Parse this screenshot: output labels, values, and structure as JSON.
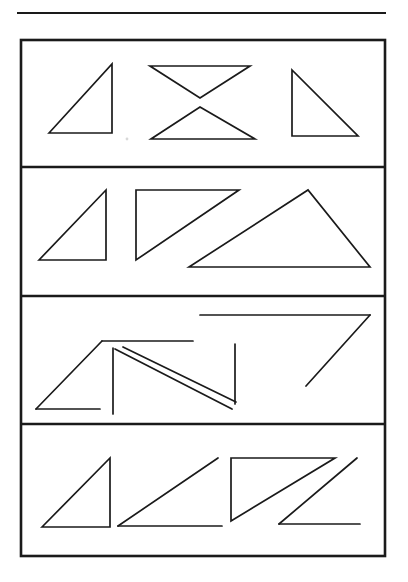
{
  "document": {
    "kind": "scanned-figure-page",
    "background_color": "#ffffff",
    "ink_color": "#1a1a1a",
    "width": 408,
    "height": 582,
    "top_rule": {
      "name": "horizontal-rule",
      "x1": 17,
      "y1": 13,
      "x2": 386,
      "y2": 13
    },
    "frame": {
      "name": "figure-frame",
      "x": 21,
      "y": 40,
      "width": 364,
      "height": 516
    },
    "dividers": [
      {
        "name": "row-divider-1",
        "y": 167
      },
      {
        "name": "row-divider-2",
        "y": 296
      },
      {
        "name": "row-divider-3",
        "y": 424
      }
    ],
    "speck": {
      "name": "scan-speck",
      "cx": 127,
      "cy": 139,
      "r": 1.4
    }
  },
  "rows": [
    {
      "name": "row-1",
      "label": "Row 1",
      "bounds": {
        "y_top": 40,
        "y_bottom": 167
      },
      "figure_count": 4,
      "figures": [
        {
          "name": "triangle-right-apex-top-right",
          "closed": true,
          "description": "Closed right triangle, right angle at top-right, hypotenuse from top-right down to bottom-left",
          "points": "108,133 108,133 108,133",
          "path": "M 49,133 L 112,64 L 112,133 Z"
        },
        {
          "name": "triangle-inverted-top",
          "closed": true,
          "description": "Closed downward-pointing triangle, horizontal top edge, apex pointing down",
          "path": "M 150,66 L 250,66 L 200,98 Z"
        },
        {
          "name": "triangle-upright-bottom",
          "closed": true,
          "description": "Closed upward-pointing triangle, apex up, horizontal bottom edge",
          "path": "M 200,107 L 255,139 L 151,139 Z"
        },
        {
          "name": "triangle-right-apex-top-left",
          "closed": true,
          "description": "Closed right triangle, vertical left side, hypotenuse from top-left to bottom-right",
          "path": "M 292,70 L 292,136 L 358,136 Z"
        }
      ]
    },
    {
      "name": "row-2",
      "label": "Row 2",
      "bounds": {
        "y_top": 167,
        "y_bottom": 296
      },
      "figure_count": 3,
      "figures": [
        {
          "name": "triangle-small-right-apex-top-right",
          "closed": true,
          "description": "Small closed right triangle, right angle at bottom-right",
          "path": "M 39,260 L 106,190 L 106,260 Z"
        },
        {
          "name": "triangle-right-apex-top-right-tall",
          "closed": true,
          "description": "Closed right triangle, vertical left side, horizontal top side, hypotenuse descending left",
          "path": "M 136,190 L 239,190 L 136,260 Z"
        },
        {
          "name": "triangle-obtuse-wide",
          "closed": true,
          "description": "Closed wide obtuse triangle, apex near top-center-right, long horizontal base",
          "path": "M 189,267 L 308,190 L 370,267 Z"
        }
      ]
    },
    {
      "name": "row-3",
      "label": "Row 3",
      "bounds": {
        "y_top": 296,
        "y_bottom": 424
      },
      "figure_count": 3,
      "note": "Incomplete / broken triangle outlines composed of open line segments",
      "figures": [
        {
          "name": "open-triangle-gapped-left",
          "closed": false,
          "description": "Open triangle: apex top, long diagonal down-left, truncated horizontal base",
          "segments": [
            "M 102,341 L 36,409",
            "M 36,409 L 100,409",
            "M 102,341 L 193,341"
          ]
        },
        {
          "name": "open-triangle-sliver-center",
          "closed": false,
          "description": "Two near-parallel diagonals forming a narrow sliver plus detached vertical strokes",
          "segments": [
            "M 113,348 L 113,414",
            "M 115,349 L 232,409",
            "M 123,347 L 236,402",
            "M 235,344 L 235,404"
          ]
        },
        {
          "name": "open-seven-shape-right",
          "closed": false,
          "description": "Seven-like open figure: long horizontal top stroke then a diagonal descending to the left",
          "segments": [
            "M 200,315 L 370,315",
            "M 370,315 L 306,386"
          ]
        }
      ]
    },
    {
      "name": "row-4",
      "label": "Row 4",
      "bounds": {
        "y_top": 424,
        "y_bottom": 556
      },
      "figure_count": 4,
      "figures": [
        {
          "name": "triangle-closed-right-angle-bottom-right",
          "closed": true,
          "description": "Closed right triangle, right angle at bottom-right, hypotenuse from top-right to bottom-left",
          "path": "M 42,527 L 110,458 L 110,527 Z"
        },
        {
          "name": "open-wedge-missing-vertical",
          "closed": false,
          "description": "Open wedge: diagonal from bottom-left up to top-right and horizontal base, right side missing",
          "segments": [
            "M 118,526 L 218,458",
            "M 118,526 L 222,526"
          ]
        },
        {
          "name": "triangle-closed-right-angle-top-left",
          "closed": true,
          "description": "Closed right triangle, vertical left side, horizontal top side, hypotenuse descending left",
          "path": "M 231,458 L 335,458 L 231,521 Z"
        },
        {
          "name": "open-z-shape",
          "closed": false,
          "description": "Open Z-like figure: diagonal descending left then a horizontal stroke to the right",
          "segments": [
            "M 357,458 L 279,524",
            "M 279,524 L 360,524"
          ]
        }
      ]
    }
  ]
}
